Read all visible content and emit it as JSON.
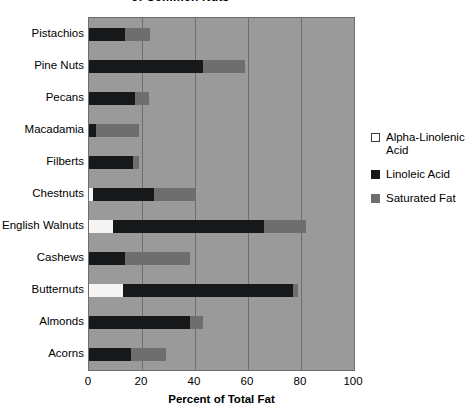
{
  "chart_data": {
    "type": "bar",
    "orientation": "horizontal",
    "stacked": true,
    "title": "of Common Nuts",
    "title_note": "top of title clipped off the top edge of the image",
    "xlabel": "Percent of Total Fat",
    "ylabel": "",
    "xlim": [
      0,
      100
    ],
    "xticks": [
      0,
      20,
      40,
      60,
      80,
      100
    ],
    "grid": true,
    "legend_position": "right",
    "categories": [
      "Pistachios",
      "Pine Nuts",
      "Pecans",
      "Macadamia",
      "Filberts",
      "Chestnuts",
      "English Walnuts",
      "Cashews",
      "Butternuts",
      "Almonds",
      "Acorns"
    ],
    "series": [
      {
        "name": "Alpha-Linolenic Acid",
        "color": "#f4f4f4",
        "values": [
          0,
          0,
          0,
          0,
          0,
          1.5,
          9,
          0,
          13,
          0,
          0
        ]
      },
      {
        "name": "Linoleic Acid",
        "color": "#17181a",
        "values": [
          13.7,
          43,
          17.5,
          2.5,
          16.5,
          23,
          57,
          13.5,
          64,
          38,
          16
        ]
      },
      {
        "name": "Saturated Fat",
        "color": "#6e6e6e",
        "values": [
          9.3,
          16,
          5,
          16.5,
          2.5,
          16,
          16,
          24.5,
          2,
          5,
          13
        ]
      }
    ],
    "totals": [
      23,
      59,
      22.5,
      19,
      19,
      40.5,
      82,
      38,
      79,
      43,
      29
    ]
  },
  "legend": {
    "items": [
      {
        "label": "Alpha-Linolenic Acid",
        "swatch": "alpha"
      },
      {
        "label": "Linoleic Acid",
        "swatch": "linoleic"
      },
      {
        "label": "Saturated Fat",
        "swatch": "saturated"
      }
    ]
  },
  "colors": {
    "plot_background": "#9a9a9a",
    "grid": "#6d6d6d",
    "page_background": "#ffffff",
    "text": "#000000"
  }
}
